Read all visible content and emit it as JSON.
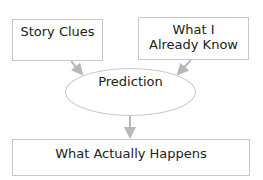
{
  "diagram": {
    "nodes": [
      {
        "id": "story-clues",
        "label": "Story Clues",
        "shape": "rectangle"
      },
      {
        "id": "what-i-already-know",
        "label_line1": "What I",
        "label_line2": "Already Know",
        "shape": "rectangle"
      },
      {
        "id": "prediction",
        "label": "Prediction",
        "shape": "ellipse"
      },
      {
        "id": "what-actually-happens",
        "label": "What Actually Happens",
        "shape": "rectangle"
      }
    ],
    "edges": [
      {
        "from": "story-clues",
        "to": "prediction"
      },
      {
        "from": "what-i-already-know",
        "to": "prediction"
      },
      {
        "from": "prediction",
        "to": "what-actually-happens"
      }
    ],
    "colors": {
      "border": "#c8c8c8",
      "arrow": "#b8b8b8",
      "text": "#222222"
    }
  }
}
